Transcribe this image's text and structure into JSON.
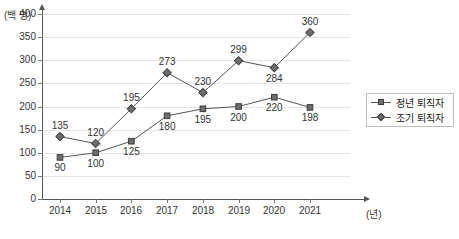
{
  "chart_data": {
    "type": "line",
    "title": "",
    "xlabel": "(년)",
    "ylabel": "(백 명)",
    "ylim": [
      0,
      400
    ],
    "yticks": [
      0,
      50,
      100,
      150,
      200,
      250,
      300,
      350,
      400
    ],
    "categories": [
      "2014",
      "2015",
      "2016",
      "2017",
      "2018",
      "2019",
      "2020",
      "2021"
    ],
    "grid": true,
    "legend_position": "right",
    "series": [
      {
        "name": "정년 퇴직자",
        "marker": "square",
        "color": "#6e6e6e",
        "values": [
          90,
          100,
          125,
          180,
          195,
          200,
          220,
          198
        ],
        "label_positions": [
          "below",
          "below",
          "below",
          "below",
          "below",
          "below",
          "below",
          "below"
        ]
      },
      {
        "name": "조기 퇴직자",
        "marker": "diamond",
        "color": "#6e6e6e",
        "values": [
          135,
          120,
          195,
          273,
          230,
          299,
          284,
          360
        ],
        "label_positions": [
          "above",
          "above",
          "above",
          "above",
          "above",
          "above",
          "below",
          "above"
        ]
      }
    ]
  },
  "colors": {
    "grid": "#e6e6e6",
    "axis": "#555555",
    "marker_fill": "#6e6e6e",
    "marker_stroke": "#3d3d3d",
    "line": "#555555",
    "text": "#333333",
    "legend_border": "#bdbdbd",
    "background": "#ffffff"
  }
}
